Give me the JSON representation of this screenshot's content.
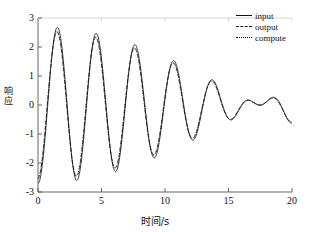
{
  "chart_data": {
    "type": "line",
    "title": "",
    "xlabel": "时间/s",
    "ylabel": "响应",
    "xlim": [
      0,
      20
    ],
    "ylim": [
      -3,
      3
    ],
    "xticks": [
      0,
      5,
      10,
      15,
      20
    ],
    "yticks": [
      3,
      2,
      1,
      0,
      -1,
      -2,
      -3
    ],
    "xtick_labels": [
      "0",
      "5",
      "10",
      "15",
      "20"
    ],
    "ytick_labels": [
      "3",
      "2",
      "1",
      "0",
      "-1",
      "-2",
      "-3"
    ],
    "grid": false,
    "legend_position": "top-right",
    "legend": [
      "input",
      "output",
      "compute"
    ],
    "model": {
      "formula": "y = 1.35*sin(2*pi*t/3.2 - 1.57) + 1.35*sin(2*pi*t/2.93 - 1.57)",
      "series_offsets": [
        0.0,
        -0.07,
        -0.07
      ],
      "series_phase_lag": [
        0.0,
        0.06,
        0.06
      ]
    },
    "series": [
      {
        "name": "input",
        "style": "solid",
        "color": "#111111",
        "x": [
          0,
          0.3,
          0.6,
          0.9,
          1.2,
          1.5,
          1.8,
          2.1,
          2.4,
          2.7,
          3.0,
          3.3,
          3.6,
          3.9,
          4.2,
          4.5,
          4.8,
          5.1,
          5.4,
          5.7,
          6.0,
          6.3,
          6.6,
          6.9,
          7.2,
          7.5,
          7.8,
          8.1,
          8.4,
          8.7,
          9.0,
          9.3,
          9.6,
          9.9,
          10.2,
          10.5,
          10.8,
          11.1,
          11.4,
          11.7,
          12.0,
          12.3,
          12.6,
          12.9,
          13.2,
          13.5,
          13.8,
          14.1,
          14.4,
          14.7,
          15.0,
          15.3,
          15.6,
          15.9,
          16.2,
          16.5,
          16.8,
          17.1,
          17.4,
          17.7,
          18.0,
          18.3,
          18.6,
          18.9,
          19.2,
          19.5,
          19.8,
          20.0
        ],
        "y": [
          0.0,
          -1.1,
          -1.2,
          -0.75,
          0.2,
          1.4,
          2.4,
          2.65,
          2.2,
          1.2,
          -0.1,
          -1.4,
          -2.4,
          -2.8,
          -2.5,
          -1.5,
          -0.2,
          0.9,
          1.4,
          1.35,
          0.8,
          0.0,
          -0.75,
          -1.2,
          -1.1,
          -0.45,
          0.6,
          1.75,
          2.55,
          2.6,
          1.95,
          0.75,
          -0.6,
          -1.9,
          -2.65,
          -2.75,
          -2.1,
          -0.95,
          0.35,
          1.3,
          1.4,
          1.05,
          0.3,
          -0.5,
          -1.1,
          -1.2,
          -0.8,
          0.1,
          1.25,
          2.25,
          2.65,
          2.3,
          1.35,
          0.05,
          -1.25,
          -2.3,
          -2.8,
          -2.55,
          -1.6,
          -0.35,
          0.8,
          1.35,
          1.4,
          0.9,
          0.1,
          -0.65,
          -1.15,
          0.9
        ]
      },
      {
        "name": "output",
        "style": "dashed",
        "color": "#111111"
      },
      {
        "name": "compute",
        "style": "dotted",
        "color": "#111111"
      }
    ]
  },
  "axes": {
    "y_title_chars": [
      "响",
      "应"
    ],
    "x_title": "时间/s"
  },
  "legend": {
    "items": [
      {
        "label": "input",
        "style": "solid"
      },
      {
        "label": "output",
        "style": "dashed"
      },
      {
        "label": "compute",
        "style": "dotted"
      }
    ]
  },
  "colors": {
    "background": "#ffffff",
    "ink": "#111111",
    "axis": "#555555"
  }
}
